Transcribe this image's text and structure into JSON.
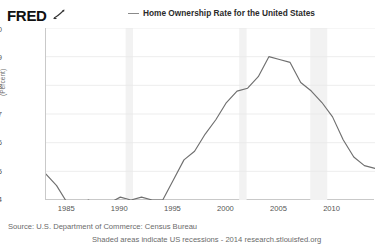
{
  "brand": {
    "logo_text": "FRED",
    "logo_mark": "swoosh-mark"
  },
  "legend": {
    "marker": "line-dash-marker",
    "label": "Home Ownership Rate for the United States"
  },
  "footer": {
    "source": "Source: U.S. Department of Commerce: Census Bureau",
    "note": "Shaded areas indicate US recessions - 2014 research.stlouisfed.org"
  },
  "colors": {
    "series_line": "#6f6f6f",
    "gridline": "#e8e8e8",
    "axis": "#c9c9c9",
    "recession_shade": "#f2f2f2",
    "text": "#555555",
    "background": "#ffffff"
  },
  "chart_data": {
    "type": "line",
    "title": "Home Ownership Rate for the United States",
    "xlabel": "",
    "ylabel": "(Percent)",
    "ylim": [
      64,
      70
    ],
    "xlim": [
      1983,
      2014
    ],
    "grid": true,
    "legend_position": "top-center",
    "y_ticks": [
      64,
      65,
      66,
      67,
      68,
      69,
      70
    ],
    "x_ticks": [
      1985,
      1990,
      1995,
      2000,
      2005,
      2010
    ],
    "annotations": [
      "Shaded areas indicate US recessions"
    ],
    "recession_bands": [
      {
        "start": 1990.5,
        "end": 1991.2
      },
      {
        "start": 2001.2,
        "end": 2001.9
      },
      {
        "start": 2007.9,
        "end": 2009.5
      }
    ],
    "series": [
      {
        "name": "Home Ownership Rate for the United States",
        "x": [
          1983,
          1984,
          1985,
          1986,
          1987,
          1988,
          1989,
          1990,
          1991,
          1992,
          1993,
          1994,
          1995,
          1996,
          1997,
          1998,
          1999,
          2000,
          2001,
          2002,
          2003,
          2004,
          2005,
          2006,
          2007,
          2008,
          2009,
          2010,
          2011,
          2012,
          2013,
          2014
        ],
        "values": [
          64.9,
          64.5,
          63.9,
          63.8,
          64.0,
          63.8,
          63.9,
          64.1,
          64.0,
          64.1,
          64.0,
          64.0,
          64.7,
          65.4,
          65.7,
          66.3,
          66.8,
          67.4,
          67.8,
          67.9,
          68.3,
          69.0,
          68.9,
          68.8,
          68.1,
          67.8,
          67.4,
          66.9,
          66.1,
          65.5,
          65.2,
          65.1
        ]
      }
    ]
  }
}
